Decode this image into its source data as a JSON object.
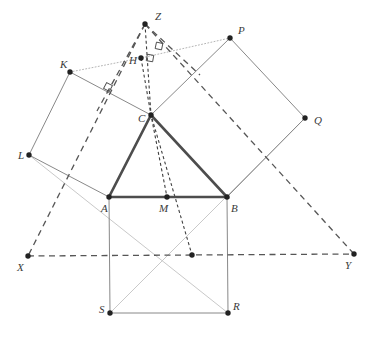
{
  "figure": {
    "background_color": "#ffffff",
    "width": 376,
    "height": 339
  },
  "colors": {
    "triangle_stroke": "#4d4d4d",
    "square_stroke": "#7a7a7a",
    "dashed_stroke": "#565656",
    "dotted_fine_stroke": "#3f3f3f",
    "faint_stroke": "#c9c9c9",
    "point_fill": "#222222",
    "label_fill": "#3a3a3a"
  },
  "points": [
    {
      "name": "Z",
      "label": "Z",
      "x": 145,
      "y": 24,
      "lx": 155,
      "ly": 20,
      "dot": true
    },
    {
      "name": "H",
      "label": "H",
      "x": 141,
      "y": 58,
      "lx": 129,
      "ly": 64,
      "dot": true
    },
    {
      "name": "K",
      "label": "K",
      "x": 70,
      "y": 72,
      "lx": 60,
      "ly": 68,
      "dot": true
    },
    {
      "name": "P",
      "label": "P",
      "x": 230,
      "y": 38,
      "lx": 238,
      "ly": 34,
      "dot": true
    },
    {
      "name": "C",
      "label": "C",
      "x": 151,
      "y": 115,
      "lx": 138,
      "ly": 122,
      "dot": true
    },
    {
      "name": "Q",
      "label": "Q",
      "x": 305,
      "y": 118,
      "lx": 314,
      "ly": 124,
      "dot": true
    },
    {
      "name": "L",
      "label": "L",
      "x": 29,
      "y": 155,
      "lx": 18,
      "ly": 159,
      "dot": true
    },
    {
      "name": "A",
      "label": "A",
      "x": 109,
      "y": 197,
      "lx": 101,
      "ly": 212,
      "dot": true
    },
    {
      "name": "M",
      "label": "M",
      "x": 167,
      "y": 197,
      "lx": 159,
      "ly": 212,
      "dot": true
    },
    {
      "name": "B",
      "label": "B",
      "x": 227,
      "y": 197,
      "lx": 231,
      "ly": 212,
      "dot": true
    },
    {
      "name": "X",
      "label": "X",
      "x": 28,
      "y": 256,
      "lx": 17,
      "ly": 271,
      "dot": true
    },
    {
      "name": "Y",
      "label": "Y",
      "x": 354,
      "y": 254,
      "lx": 345,
      "ly": 269,
      "dot": true
    },
    {
      "name": "N",
      "label": "",
      "x": 192,
      "y": 255,
      "lx": 0,
      "ly": 0,
      "dot": true
    },
    {
      "name": "S",
      "label": "S",
      "x": 110,
      "y": 313,
      "lx": 99,
      "ly": 313,
      "dot": true
    },
    {
      "name": "R",
      "label": "R",
      "x": 228,
      "y": 313,
      "lx": 233,
      "ly": 310,
      "dot": true
    }
  ],
  "triangle": {
    "name": "triangle-ABC",
    "vertices": [
      "A",
      "B",
      "C"
    ],
    "path": "109,197 227,197 151,115",
    "stroke_width": 2.6
  },
  "squares": [
    {
      "name": "square-ABRS",
      "label": "square on AB",
      "path": "109,197 227,197 228,313 110,313"
    },
    {
      "name": "square-ACKL",
      "label": "square on AC",
      "path": "109,197 151,115 70,72 29,155"
    },
    {
      "name": "square-BCPQ",
      "label": "square on BC",
      "path": "151,115 227,197 305,118 230,38"
    }
  ],
  "dashed_lines": [
    {
      "name": "line-XY",
      "path": "28,256 354,254"
    },
    {
      "name": "line-Z-X",
      "path": "145,24 28,256"
    },
    {
      "name": "line-Z-Y",
      "path": "145,24 354,254"
    },
    {
      "name": "line-Z-K-ext",
      "path": "145,24 97,111"
    },
    {
      "name": "line-Z-P-ext",
      "path": "145,24 200,75"
    }
  ],
  "fine_dotted_lines": [
    {
      "name": "cevian-H-C-N",
      "path": "141,58 151,115 192,255"
    },
    {
      "name": "cevian-Z-C-M",
      "path": "145,24 151,115 167,197"
    }
  ],
  "dotted_faint_lines": [
    {
      "name": "line-K-H-P",
      "path": "70,72 141,58 230,38"
    }
  ],
  "faint_lines": [
    {
      "name": "line-L-R",
      "path": "29,155 228,313"
    },
    {
      "name": "line-Q-S",
      "path": "305,118 110,313"
    }
  ],
  "right_angle_markers": [
    {
      "name": "right-angle-at-AC-square",
      "x": 108,
      "y": 87,
      "rotation": 28
    },
    {
      "name": "right-angle-near-H",
      "x": 150,
      "y": 58,
      "rotation": 10
    },
    {
      "name": "right-angle-near-Z-foot",
      "x": 159,
      "y": 46,
      "rotation": 12
    }
  ]
}
